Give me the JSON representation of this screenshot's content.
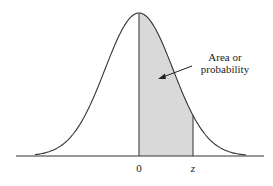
{
  "diagram": {
    "annotation": [
      "Area or",
      "probability"
    ],
    "axis_labels": {
      "origin": "0",
      "z": "z"
    },
    "colors": {
      "shade": "#d9d9d9",
      "line": "#333333"
    }
  }
}
